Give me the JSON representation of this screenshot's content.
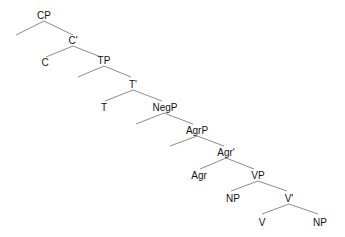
{
  "diagram": {
    "type": "syntax-tree",
    "colors": {
      "line": "#8c8c8c",
      "text": "#111111",
      "background": "#ffffff"
    },
    "nodes": {
      "cp": "CP",
      "c_bar": "C'",
      "c": "C",
      "tp": "TP",
      "t_bar": "T'",
      "t": "T",
      "negp": "NegP",
      "agrp": "AgrP",
      "agr_bar": "Agr'",
      "agr": "Agr",
      "vp": "VP",
      "np_spec": "NP",
      "v_bar": "V'",
      "v": "V",
      "np_comp": "NP"
    }
  }
}
